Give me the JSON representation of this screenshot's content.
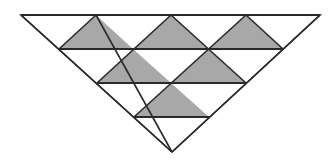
{
  "figure": {
    "colors": {
      "stroke": "#2a2a2a",
      "shade": "#a8a8a8",
      "background": "#ffffff"
    },
    "outline": [
      [
        21,
        15
      ],
      [
        320,
        15
      ],
      [
        172,
        152
      ]
    ],
    "horizontal_lines": [
      {
        "y": 15,
        "x1": 21,
        "x2": 320
      },
      {
        "y": 49,
        "x1": 59,
        "x2": 283
      },
      {
        "y": 83,
        "x1": 97,
        "x2": 246
      },
      {
        "y": 117,
        "x1": 134,
        "x2": 209
      }
    ],
    "diagonal_lines": [
      [
        [
          96,
          15
        ],
        [
          172,
          152
        ]
      ],
      [
        [
          171,
          15
        ],
        [
          246,
          83
        ]
      ],
      [
        [
          246,
          15
        ],
        [
          283,
          49
        ]
      ],
      [
        [
          96,
          15
        ],
        [
          59,
          49
        ]
      ],
      [
        [
          171,
          15
        ],
        [
          97,
          83
        ]
      ],
      [
        [
          246,
          15
        ],
        [
          134,
          117
        ]
      ],
      [
        [
          320,
          15
        ],
        [
          172,
          152
        ]
      ],
      [
        [
          21,
          15
        ],
        [
          172,
          152
        ]
      ]
    ],
    "shaded_triangles": [
      [
        [
          96,
          15
        ],
        [
          59,
          49
        ],
        [
          133,
          49
        ]
      ],
      [
        [
          171,
          15
        ],
        [
          133,
          49
        ],
        [
          208,
          49
        ]
      ],
      [
        [
          246,
          15
        ],
        [
          208,
          49
        ],
        [
          283,
          49
        ]
      ],
      [
        [
          133,
          49
        ],
        [
          97,
          83
        ],
        [
          171,
          83
        ]
      ],
      [
        [
          208,
          49
        ],
        [
          171,
          83
        ],
        [
          246,
          83
        ]
      ],
      [
        [
          171,
          83
        ],
        [
          134,
          117
        ],
        [
          209,
          117
        ]
      ]
    ],
    "shaded_count": 6,
    "rows": 4
  }
}
